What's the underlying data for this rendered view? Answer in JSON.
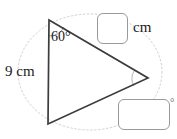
{
  "figure": {
    "type": "triangle-geometry-diagram",
    "background_color": "#ffffff",
    "stroke_color": "#3c3c3c",
    "guide_color": "#c9c9c9",
    "given_side_label": "9 cm",
    "given_angle_label": "60°",
    "vertices": {
      "top": [
        49,
        20
      ],
      "bottom": [
        48,
        124
      ],
      "right": [
        148,
        78
      ]
    }
  },
  "inputs": {
    "side_answer": {
      "value": "",
      "placeholder": "",
      "unit": "cm"
    },
    "angle_answer": {
      "value": "",
      "placeholder": "",
      "unit": "°"
    }
  },
  "labels": {
    "cm_unit": "cm",
    "degree_unit": "°",
    "side_length": "9 cm",
    "angle_measure": "60°"
  }
}
